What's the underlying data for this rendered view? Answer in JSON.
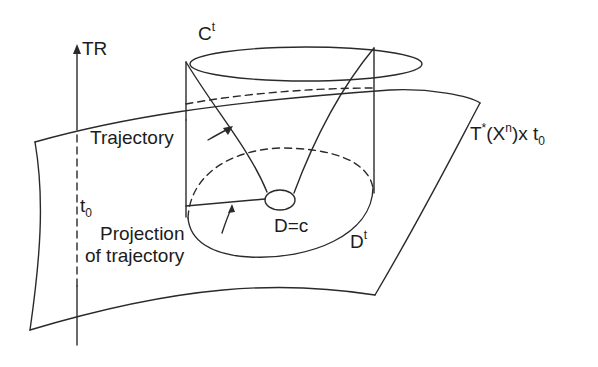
{
  "diagram": {
    "labels": {
      "axis": "TR",
      "axis_time": "t",
      "axis_time_sub": "0",
      "cylinder_top": "C",
      "cylinder_top_sup": "t",
      "trajectory": "Trajectory",
      "surface": "T",
      "surface_sup_star": "*",
      "surface_mid": "(X",
      "surface_sup_n": "n",
      "surface_end": ")x t",
      "surface_sub": "0",
      "projection_line1": "Projection",
      "projection_line2": "of trajectory",
      "small_disc": "D=c",
      "base_disc": "D",
      "base_disc_sup": "t"
    },
    "colors": {
      "ink": "#2a2a2a",
      "background": "#ffffff"
    }
  }
}
